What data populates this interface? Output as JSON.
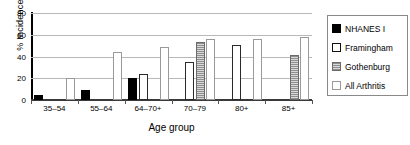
{
  "chart_data": {
    "type": "bar",
    "title": "",
    "xlabel": "Age group",
    "ylabel": "% Incidence",
    "ylim": [
      0,
      80
    ],
    "yticks": [
      0,
      20,
      40,
      60,
      80
    ],
    "grid": true,
    "legend_position": "right",
    "categories": [
      "35–54",
      "55–64",
      "64–70+",
      "70–79",
      "80+",
      "85+"
    ],
    "series": [
      {
        "name": "NHANES I",
        "key": "nhanes",
        "values": [
          5,
          9,
          20,
          null,
          null,
          null
        ]
      },
      {
        "name": "Framingham",
        "key": "framingham",
        "values": [
          null,
          null,
          24,
          35,
          51,
          null
        ]
      },
      {
        "name": "Gothenburg",
        "key": "gothenburg",
        "values": [
          null,
          null,
          null,
          53,
          null,
          41
        ]
      },
      {
        "name": "All Arthritis",
        "key": "allarthritis",
        "values": [
          20,
          44,
          49,
          56,
          56,
          58
        ]
      }
    ]
  },
  "legend": {
    "items": [
      {
        "label": "NHANES I",
        "key": "nhanes"
      },
      {
        "label": "Framingham",
        "key": "framingham"
      },
      {
        "label": "Gothenburg",
        "key": "gothenburg"
      },
      {
        "label": "All Arthritis",
        "key": "allarthritis"
      }
    ]
  },
  "colors": {
    "nhanes": "#000000",
    "framingham": "#ffffff",
    "gothenburg": "#8f8f8f",
    "allarthritis": "#ffffff",
    "grid": "#b8b8b8",
    "axis": "#000000"
  }
}
